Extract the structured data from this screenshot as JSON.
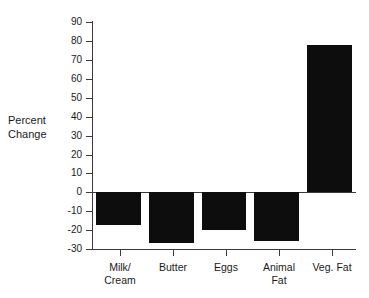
{
  "chart_data": {
    "type": "bar",
    "title": "",
    "xlabel": "",
    "ylabel": "Percent\nChange",
    "categories": [
      "Milk/\nCream",
      "Butter",
      "Eggs",
      "Animal\nFat",
      "Veg. Fat"
    ],
    "values": [
      -17.5,
      -27,
      -20,
      -26,
      78
    ],
    "ylim": [
      -30,
      90
    ],
    "ytick_values": [
      90,
      80,
      70,
      60,
      50,
      40,
      30,
      20,
      10,
      0,
      -10,
      -20,
      -30
    ],
    "ytick_labels": [
      "90",
      "80",
      "70",
      "60",
      "50",
      "40",
      "30",
      "20",
      "10",
      "0",
      "-10",
      "-20",
      "-30"
    ],
    "grid": false,
    "legend": "none",
    "bar_color": "#0d0d0d",
    "axis_color": "#3a3a3a",
    "background_color": "#ffffff"
  }
}
